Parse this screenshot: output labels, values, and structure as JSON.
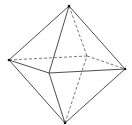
{
  "diagram": {
    "title": "",
    "shape": "octahedron",
    "colors": {
      "background": "#ffffff",
      "solid_edge": "#3a3a3a",
      "hidden_edge": "#555555",
      "vertex": "#111111"
    },
    "vertices": {
      "top": [
        69,
        6
      ],
      "left": [
        9,
        60
      ],
      "right": [
        125,
        69
      ],
      "bottom": [
        65,
        123
      ],
      "front": [
        49,
        73
      ],
      "back": [
        87,
        56
      ]
    },
    "edges": [
      {
        "from": "top",
        "to": "left",
        "style": "solid"
      },
      {
        "from": "top",
        "to": "right",
        "style": "solid"
      },
      {
        "from": "top",
        "to": "front",
        "style": "solid"
      },
      {
        "from": "top",
        "to": "back",
        "style": "dashed"
      },
      {
        "from": "left",
        "to": "front",
        "style": "solid"
      },
      {
        "from": "front",
        "to": "right",
        "style": "solid"
      },
      {
        "from": "left",
        "to": "back",
        "style": "dashed"
      },
      {
        "from": "back",
        "to": "right",
        "style": "dashed"
      },
      {
        "from": "bottom",
        "to": "left",
        "style": "solid"
      },
      {
        "from": "bottom",
        "to": "right",
        "style": "solid"
      },
      {
        "from": "bottom",
        "to": "front",
        "style": "solid"
      },
      {
        "from": "bottom",
        "to": "back",
        "style": "dashed"
      }
    ]
  }
}
